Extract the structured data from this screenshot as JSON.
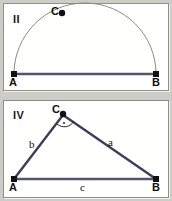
{
  "figure": {
    "background_color": "#cdcdc8",
    "panel_fill": "#fffffd",
    "panel_border": "#8f8f8a"
  },
  "panels": [
    {
      "id": "II",
      "roman_label": "II",
      "description": "semicircle-over-segment-AB",
      "baseline_color": "#4a4a6a",
      "arc_color": "#888888",
      "points": [
        {
          "name": "A",
          "label": "A",
          "x": 13,
          "y": 73,
          "marker": "square"
        },
        {
          "name": "B",
          "label": "B",
          "x": 155,
          "y": 73,
          "marker": "square"
        },
        {
          "name": "C",
          "label": "C",
          "x": 61,
          "y": 12,
          "marker": "dot"
        }
      ],
      "segments": [
        {
          "name": "AB",
          "label": ""
        }
      ]
    },
    {
      "id": "IV",
      "roman_label": "IV",
      "description": "right-triangle-ABC-with-sides-a-b-c",
      "baseline_color": "#4a4a6a",
      "leg_color": "#3a3a55",
      "points": [
        {
          "name": "A",
          "label": "A",
          "x": 13,
          "y": 180,
          "marker": "square"
        },
        {
          "name": "B",
          "label": "B",
          "x": 155,
          "y": 180,
          "marker": "square"
        },
        {
          "name": "C",
          "label": "C",
          "x": 62,
          "y": 115,
          "marker": "dot"
        }
      ],
      "right_angle": {
        "at": "C",
        "marker": "arc-with-dot"
      },
      "side_labels": [
        {
          "name": "a",
          "label": "a",
          "x": 108,
          "y": 137
        },
        {
          "name": "b",
          "label": "b",
          "x": 29,
          "y": 139
        },
        {
          "name": "c",
          "label": "c",
          "x": 80,
          "y": 182
        }
      ]
    }
  ]
}
